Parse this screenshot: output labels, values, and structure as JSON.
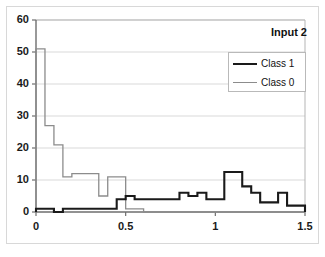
{
  "chart_data": {
    "type": "line",
    "title": "Input 2",
    "xlabel": "",
    "ylabel": "",
    "xlim": [
      0,
      1.5
    ],
    "ylim": [
      0,
      60
    ],
    "grid": "horizontal",
    "legend_position": "top-right",
    "ytick_labels": [
      "0",
      "10",
      "20",
      "30",
      "40",
      "50",
      "60"
    ],
    "ytick_values": [
      0,
      10,
      20,
      30,
      40,
      50,
      60
    ],
    "xtick_labels": [
      "0",
      "0.5",
      "1",
      "1.5"
    ],
    "xtick_values": [
      0,
      0.5,
      1,
      1.5
    ],
    "bin_edges": [
      0.0,
      0.05,
      0.1,
      0.15,
      0.2,
      0.25,
      0.3,
      0.35,
      0.4,
      0.45,
      0.5,
      0.55,
      0.6,
      0.65,
      0.7,
      0.75,
      0.8,
      0.85,
      0.9,
      0.95,
      1.0,
      1.05,
      1.1,
      1.15,
      1.2,
      1.25,
      1.3,
      1.35,
      1.4,
      1.45,
      1.5
    ],
    "series": [
      {
        "name": "Class 1",
        "color": "#1a1a1a",
        "line_width": 2.1,
        "values": [
          1,
          1,
          0,
          1,
          1,
          1,
          1,
          1,
          1,
          4,
          5,
          4,
          4,
          4,
          4,
          4,
          6,
          5,
          6,
          4,
          4,
          12.5,
          12.5,
          8,
          6,
          3,
          3,
          6,
          2,
          2
        ]
      },
      {
        "name": "Class 0",
        "color": "#8c8c8c",
        "line_width": 1.3,
        "values": [
          51,
          27,
          21,
          11,
          12,
          12,
          12,
          5,
          11,
          11,
          1,
          1,
          0,
          0,
          0,
          0,
          0,
          0,
          0,
          0,
          0,
          0,
          0,
          0,
          0,
          0,
          0,
          0,
          0,
          0
        ]
      }
    ]
  },
  "plot_geometry": {
    "left": 36,
    "top": 20,
    "right": 305,
    "bottom": 212
  }
}
